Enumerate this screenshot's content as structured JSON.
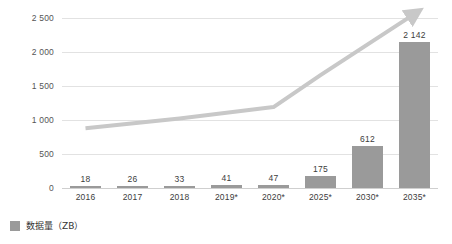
{
  "chart_data": {
    "type": "bar",
    "title": "",
    "subtitle": "",
    "xlabel": "",
    "ylabel": "",
    "categories": [
      "2016",
      "2017",
      "2018",
      "2019*",
      "2020*",
      "2025*",
      "2030*",
      "2035*"
    ],
    "values": [
      18,
      26,
      33,
      41,
      47,
      175,
      612,
      2142
    ],
    "value_labels": [
      "18",
      "26",
      "33",
      "41",
      "47",
      "175",
      "612",
      "2 142"
    ],
    "ylim": [
      0,
      2500
    ],
    "ytick_values": [
      0,
      500,
      1000,
      1500,
      2000,
      2500
    ],
    "ytick_labels": [
      "0",
      "500",
      "1 000",
      "1 500",
      "2 000",
      "2 500"
    ],
    "grid": true,
    "legend_position": "bottom-left",
    "series": [
      {
        "name": "数据量（ZB）",
        "type": "bar",
        "color": "#9a9a9a",
        "values": [
          18,
          26,
          33,
          41,
          47,
          175,
          612,
          2142
        ]
      },
      {
        "name": "trend-arrow",
        "type": "line",
        "color": "#c8c8c8",
        "arrow": true,
        "points": [
          {
            "x": "2016",
            "y": 880
          },
          {
            "x": "2018",
            "y": 1020
          },
          {
            "x": "2020*",
            "y": 1190
          },
          {
            "x": "2025*",
            "y": 1660
          },
          {
            "x": "2035*",
            "y": 2560
          }
        ]
      }
    ]
  },
  "legend": {
    "items": [
      {
        "label": "数据量（ZB）",
        "color": "#9a9a9a"
      }
    ]
  },
  "colors": {
    "bar": "#9a9a9a",
    "trend_line": "#c8c8c8",
    "gridline": "#e2e2e2",
    "axis": "#cfcfcf",
    "text": "#3c3c3c",
    "background": "#ffffff"
  }
}
